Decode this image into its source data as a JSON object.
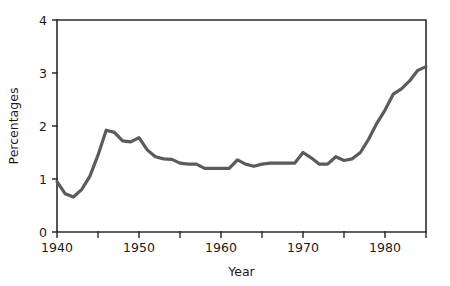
{
  "figure": {
    "background_color": "#ffffff",
    "line_color": "#5b5b5b",
    "axis_color": "#2b2b2b"
  },
  "chart_data": {
    "type": "line",
    "title": "",
    "subtitle": "",
    "xlabel": "Year",
    "ylabel": "Percentages",
    "xlim": [
      1940,
      1985
    ],
    "ylim": [
      0,
      4
    ],
    "grid": false,
    "legend": "none",
    "x_ticks": [
      1940,
      1950,
      1960,
      1970,
      1980
    ],
    "x_tick_labels": [
      "1940",
      "1950",
      "1960",
      "1970",
      "1980"
    ],
    "x_minor_ticks": [
      1945,
      1955,
      1965,
      1975,
      1985
    ],
    "y_ticks": [
      0,
      1,
      2,
      3,
      4
    ],
    "y_tick_labels": [
      "0",
      "1",
      "2",
      "3",
      "4"
    ],
    "x": [
      1940,
      1941,
      1942,
      1943,
      1944,
      1945,
      1946,
      1947,
      1948,
      1949,
      1950,
      1951,
      1952,
      1953,
      1954,
      1955,
      1956,
      1957,
      1958,
      1959,
      1960,
      1961,
      1962,
      1963,
      1964,
      1965,
      1966,
      1967,
      1968,
      1969,
      1970,
      1971,
      1972,
      1973,
      1974,
      1975,
      1976,
      1977,
      1978,
      1979,
      1980,
      1981,
      1982,
      1983,
      1984,
      1985
    ],
    "values": [
      0.95,
      0.72,
      0.66,
      0.8,
      1.05,
      1.45,
      1.92,
      1.88,
      1.72,
      1.7,
      1.78,
      1.55,
      1.42,
      1.38,
      1.37,
      1.3,
      1.28,
      1.28,
      1.2,
      1.2,
      1.2,
      1.2,
      1.36,
      1.28,
      1.24,
      1.28,
      1.3,
      1.3,
      1.3,
      1.3,
      1.5,
      1.4,
      1.28,
      1.28,
      1.42,
      1.35,
      1.38,
      1.5,
      1.75,
      2.05,
      2.3,
      2.6,
      2.7,
      2.85,
      3.05,
      3.12
    ],
    "series": [
      {
        "name": "Percentages",
        "values": [
          0.95,
          0.72,
          0.66,
          0.8,
          1.05,
          1.45,
          1.92,
          1.88,
          1.72,
          1.7,
          1.78,
          1.55,
          1.42,
          1.38,
          1.37,
          1.3,
          1.28,
          1.28,
          1.2,
          1.2,
          1.2,
          1.2,
          1.36,
          1.28,
          1.24,
          1.28,
          1.3,
          1.3,
          1.3,
          1.3,
          1.5,
          1.4,
          1.28,
          1.28,
          1.42,
          1.35,
          1.38,
          1.5,
          1.75,
          2.05,
          2.3,
          2.6,
          2.7,
          2.85,
          3.05,
          3.12
        ]
      }
    ]
  }
}
